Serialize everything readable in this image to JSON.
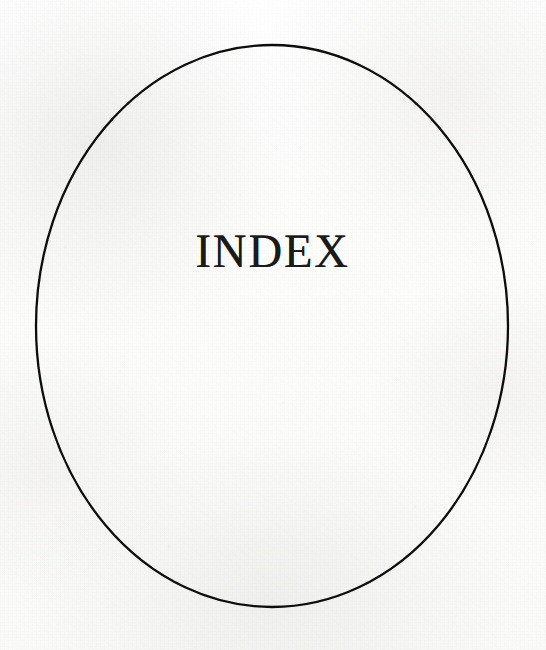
{
  "page": {
    "kind": "book-section-divider",
    "width": 546,
    "height": 650,
    "paper_color": "#fcfcfb",
    "ink_color": "#1a1a1a"
  },
  "title": {
    "text": "INDEX",
    "letter_spacing_px": 2,
    "font_size_px": 48,
    "center_x": 278,
    "baseline_y": 272
  },
  "ornament": {
    "shape_name": "ellipse-frame",
    "center_x": 272,
    "center_y": 326,
    "radius_x": 236,
    "radius_y": 281,
    "stroke_color": "#0d0d0d",
    "stroke_width_px": 2.3,
    "fill": "none"
  }
}
